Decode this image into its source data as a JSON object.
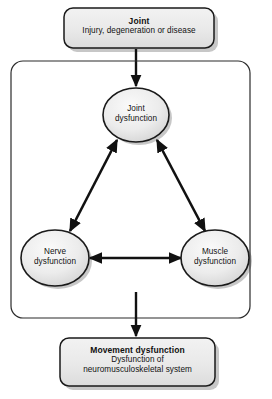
{
  "diagram": {
    "type": "flowchart",
    "background_color": "#ffffff",
    "node_fill_color": "#e8e8e8",
    "node_stroke_color": "#1a1a1a",
    "arrow_color": "#111111",
    "top_box": {
      "title": "Joint",
      "subtitle": "Injury, degeneration or disease"
    },
    "cycle_container": {
      "label": "dysfunction-cycle-container"
    },
    "nodes": [
      {
        "id": "joint-dysfunction",
        "line1": "Joint",
        "line2": "dysfunction"
      },
      {
        "id": "nerve-dysfunction",
        "line1": "Nerve",
        "line2": "dysfunction"
      },
      {
        "id": "muscle-dysfunction",
        "line1": "Muscle",
        "line2": "dysfunction"
      }
    ],
    "bottom_box": {
      "title": "Movement dysfunction",
      "subtitle_line1": "Dysfunction of",
      "subtitle_line2": "neuromusculoskeletal system"
    },
    "connectors": [
      {
        "id": "joint-to-joint-dysfunction",
        "style": "single-arrow"
      },
      {
        "id": "joint-nerve-link",
        "style": "double-arrow"
      },
      {
        "id": "joint-muscle-link",
        "style": "double-arrow"
      },
      {
        "id": "nerve-muscle-link",
        "style": "double-arrow"
      },
      {
        "id": "cycle-to-movement-dysfunction",
        "style": "single-arrow"
      }
    ]
  }
}
